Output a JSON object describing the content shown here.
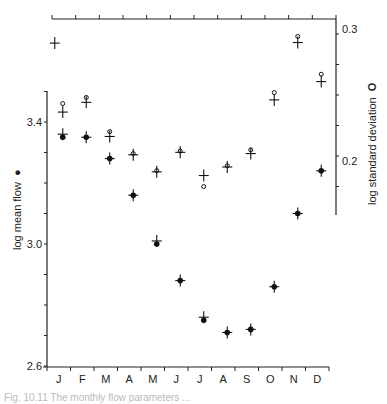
{
  "chart_data": {
    "type": "scatter",
    "title": "",
    "categories": [
      "J",
      "F",
      "M",
      "A",
      "M",
      "J",
      "J",
      "A",
      "S",
      "O",
      "N",
      "D"
    ],
    "xlabel": "",
    "ylabel_left": "log mean flow",
    "ylabel_left_marker": "●",
    "ylabel_right": "log standard deviation",
    "ylabel_right_marker": "O",
    "left_axis": {
      "ylim": [
        2.6,
        3.5
      ],
      "labeled_ticks": [
        2.6,
        3.0,
        3.4
      ],
      "tick_step": 0.1
    },
    "right_axis": {
      "ylim": [
        0.152,
        0.3
      ],
      "labeled_ticks": [
        0.2,
        0.3
      ],
      "tick_step": 0.025
    },
    "series": [
      {
        "name": "log mean flow (observed)",
        "marker": "filled-circle",
        "axis": "left",
        "values": [
          3.35,
          3.35,
          3.28,
          3.16,
          3.0,
          2.88,
          2.75,
          2.71,
          2.72,
          2.86,
          3.1,
          3.24
        ]
      },
      {
        "name": "log mean flow (fitted)",
        "marker": "plus",
        "axis": "left",
        "values": [
          3.36,
          3.35,
          3.28,
          3.16,
          3.01,
          2.88,
          2.76,
          2.71,
          2.72,
          2.86,
          3.1,
          3.24
        ]
      },
      {
        "name": "log standard deviation (observed)",
        "marker": "open-circle",
        "axis": "right",
        "values": [
          0.243,
          0.248,
          0.22,
          0.202,
          0.188,
          0.204,
          0.175,
          0.192,
          0.205,
          0.252,
          0.298,
          0.267
        ]
      },
      {
        "name": "log standard deviation (fitted)",
        "marker": "plus",
        "axis": "right",
        "values": [
          0.236,
          0.244,
          0.216,
          0.201,
          0.187,
          0.203,
          0.184,
          0.191,
          0.202,
          0.246,
          0.293,
          0.261
        ]
      }
    ],
    "extra_points": [
      {
        "marker": "plus",
        "x_category_index": 0,
        "axis": "right",
        "value": 0.295,
        "note": "isolated plus above January"
      }
    ],
    "grid": false,
    "legend": "none (markers described in axis labels)"
  },
  "caption": "Fig. 10.11 The monthly flow parameters ..."
}
